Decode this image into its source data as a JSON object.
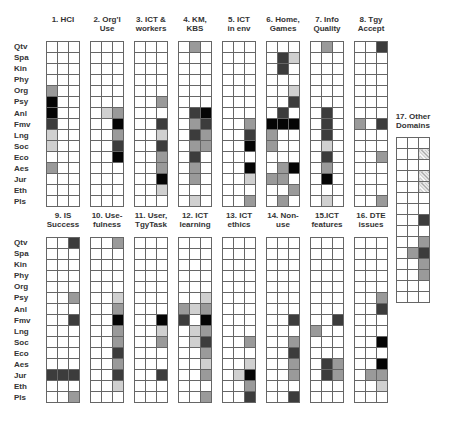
{
  "chart_data": {
    "type": "heatmap",
    "title": "",
    "rows": [
      "Qtv",
      "Spa",
      "Kin",
      "Phy",
      "Org",
      "Psy",
      "Anl",
      "Fmv",
      "Lng",
      "Soc",
      "Eco",
      "Aes",
      "Jur",
      "Eth",
      "Pls"
    ],
    "columns_per_panel": 3,
    "scale": {
      "0": "none",
      "1": "light",
      "2": "medium",
      "3": "dark",
      "4": "black",
      "h": "hatched"
    },
    "panels": [
      {
        "id": 1,
        "title": [
          "1. HCI",
          ""
        ],
        "cells": {
          "Org": [
            2,
            0,
            0
          ],
          "Psy": [
            4,
            0,
            0
          ],
          "Anl": [
            4,
            0,
            0
          ],
          "Fmv": [
            3,
            0,
            0
          ],
          "Lng": [
            1,
            0,
            0
          ],
          "Soc": [
            1,
            0,
            0
          ],
          "Aes": [
            2,
            0,
            0
          ]
        }
      },
      {
        "id": 2,
        "title": [
          "2. Org'l",
          "Use"
        ],
        "cells": {
          "Anl": [
            0,
            1,
            2
          ],
          "Fmv": [
            0,
            0,
            4
          ],
          "Lng": [
            0,
            0,
            2
          ],
          "Soc": [
            0,
            0,
            3
          ],
          "Eco": [
            0,
            0,
            4
          ]
        }
      },
      {
        "id": 3,
        "title": [
          "3. ICT &",
          "workers"
        ],
        "cells": {
          "Psy": [
            0,
            0,
            2
          ],
          "Fmv": [
            0,
            0,
            3
          ],
          "Lng": [
            0,
            0,
            1
          ],
          "Soc": [
            0,
            0,
            3
          ],
          "Eco": [
            0,
            0,
            2
          ],
          "Aes": [
            0,
            0,
            2
          ],
          "Jur": [
            0,
            0,
            4
          ],
          "Eth": [
            0,
            0,
            1
          ]
        }
      },
      {
        "id": 4,
        "title": [
          "4. KM,",
          "KBS"
        ],
        "cells": {
          "Qtv": [
            0,
            2,
            0
          ],
          "Anl": [
            0,
            3,
            4
          ],
          "Fmv": [
            0,
            2,
            3
          ],
          "Lng": [
            0,
            3,
            2
          ],
          "Soc": [
            0,
            2,
            2
          ],
          "Eco": [
            0,
            3,
            0
          ],
          "Aes": [
            0,
            2,
            0
          ],
          "Jur": [
            0,
            2,
            0
          ],
          "Pls": [
            0,
            1,
            0
          ]
        }
      },
      {
        "id": 5,
        "title": [
          "5. ICT",
          "in env"
        ],
        "cells": {
          "Fmv": [
            0,
            0,
            2
          ],
          "Lng": [
            0,
            0,
            3
          ],
          "Soc": [
            0,
            0,
            4
          ],
          "Aes": [
            0,
            0,
            4
          ],
          "Jur": [
            0,
            0,
            1
          ],
          "Pls": [
            0,
            0,
            2
          ]
        }
      },
      {
        "id": 6,
        "title": [
          "6. Home,",
          "Games"
        ],
        "cells": {
          "Spa": [
            0,
            3,
            1
          ],
          "Kin": [
            0,
            3,
            0
          ],
          "Org": [
            0,
            0,
            1
          ],
          "Psy": [
            0,
            0,
            3
          ],
          "Anl": [
            0,
            3,
            0
          ],
          "Fmv": [
            4,
            4,
            4
          ],
          "Lng": [
            2,
            0,
            0
          ],
          "Soc": [
            2,
            0,
            0
          ],
          "Aes": [
            0,
            2,
            4
          ],
          "Jur": [
            2,
            2,
            0
          ],
          "Eth": [
            0,
            0,
            2
          ],
          "Pls": [
            0,
            2,
            0
          ]
        }
      },
      {
        "id": 7,
        "title": [
          "7. Info",
          "Quality"
        ],
        "cells": {
          "Qtv": [
            0,
            2,
            0
          ],
          "Anl": [
            0,
            3,
            0
          ],
          "Fmv": [
            0,
            3,
            0
          ],
          "Lng": [
            0,
            3,
            0
          ],
          "Soc": [
            0,
            1,
            0
          ],
          "Eco": [
            0,
            3,
            0
          ],
          "Aes": [
            0,
            2,
            0
          ],
          "Jur": [
            0,
            4,
            0
          ],
          "Pls": [
            0,
            1,
            0
          ]
        }
      },
      {
        "id": 8,
        "title": [
          "8. Tgy",
          "Accept"
        ],
        "cells": {
          "Qtv": [
            0,
            0,
            3
          ],
          "Fmv": [
            2,
            0,
            3
          ],
          "Eco": [
            0,
            0,
            2
          ],
          "Pls": [
            0,
            0,
            2
          ]
        }
      },
      {
        "id": 9,
        "title": [
          "9. IS",
          "Success"
        ],
        "cells": {
          "Qtv": [
            0,
            0,
            3
          ],
          "Psy": [
            0,
            0,
            2
          ],
          "Fmv": [
            0,
            0,
            3
          ],
          "Jur": [
            3,
            3,
            3
          ],
          "Pls": [
            0,
            0,
            2
          ]
        }
      },
      {
        "id": 10,
        "title": [
          "10. Use-",
          "fulness"
        ],
        "cells": {
          "Qtv": [
            0,
            0,
            2
          ],
          "Psy": [
            0,
            0,
            1
          ],
          "Anl": [
            0,
            0,
            2
          ],
          "Fmv": [
            0,
            0,
            4
          ],
          "Lng": [
            0,
            0,
            2
          ],
          "Soc": [
            0,
            0,
            2
          ],
          "Eco": [
            0,
            0,
            3
          ],
          "Aes": [
            0,
            0,
            2
          ],
          "Jur": [
            0,
            0,
            3
          ],
          "Eth": [
            0,
            0,
            1
          ]
        }
      },
      {
        "id": 11,
        "title": [
          "11. User,",
          "TgyTask"
        ],
        "cells": {
          "Fmv": [
            0,
            0,
            4
          ],
          "Lng": [
            0,
            0,
            1
          ],
          "Soc": [
            0,
            0,
            2
          ],
          "Jur": [
            0,
            0,
            3
          ]
        }
      },
      {
        "id": 12,
        "title": [
          "12. ICT",
          "learning"
        ],
        "cells": {
          "Psy": [
            0,
            0,
            1
          ],
          "Anl": [
            2,
            1,
            2
          ],
          "Fmv": [
            3,
            0,
            4
          ],
          "Lng": [
            0,
            1,
            2
          ],
          "Soc": [
            0,
            1,
            3
          ],
          "Eco": [
            0,
            0,
            2
          ],
          "Aes": [
            0,
            0,
            1
          ],
          "Jur": [
            0,
            0,
            2
          ],
          "Pls": [
            0,
            0,
            2
          ]
        }
      },
      {
        "id": 13,
        "title": [
          "13. ICT",
          "ethics"
        ],
        "cells": {
          "Soc": [
            0,
            0,
            2
          ],
          "Aes": [
            0,
            0,
            1
          ],
          "Jur": [
            0,
            1,
            4
          ],
          "Eth": [
            0,
            0,
            2
          ],
          "Pls": [
            0,
            0,
            3
          ]
        }
      },
      {
        "id": 14,
        "title": [
          "14. Non-",
          "use"
        ],
        "cells": {
          "Fmv": [
            0,
            0,
            3
          ],
          "Soc": [
            0,
            0,
            2
          ],
          "Eco": [
            0,
            0,
            3
          ],
          "Aes": [
            0,
            0,
            2
          ],
          "Jur": [
            0,
            0,
            2
          ],
          "Pls": [
            0,
            0,
            3
          ]
        }
      },
      {
        "id": 15,
        "title": [
          "15.ICT",
          "features"
        ],
        "cells": {
          "Fmv": [
            0,
            0,
            3
          ],
          "Lng": [
            2,
            0,
            0
          ],
          "Aes": [
            0,
            3,
            2
          ],
          "Jur": [
            0,
            3,
            2
          ]
        }
      },
      {
        "id": 16,
        "title": [
          "16. DTE",
          "issues"
        ],
        "cells": {
          "Psy": [
            0,
            0,
            2
          ],
          "Anl": [
            0,
            0,
            3
          ],
          "Soc": [
            0,
            0,
            4
          ],
          "Aes": [
            0,
            0,
            4
          ],
          "Jur": [
            0,
            2,
            2
          ],
          "Eth": [
            0,
            0,
            1
          ]
        }
      },
      {
        "id": 17,
        "title": [
          "17. Other",
          "Domains"
        ],
        "cells": {
          "Spa": [
            0,
            0,
            "h"
          ],
          "Phy": [
            0,
            0,
            "h"
          ],
          "Org": [
            0,
            0,
            "h"
          ],
          "Fmv": [
            0,
            0,
            3
          ],
          "Soc": [
            0,
            0,
            2
          ],
          "Eco": [
            0,
            2,
            3
          ],
          "Aes": [
            0,
            0,
            2
          ],
          "Jur": [
            0,
            0,
            2
          ]
        }
      }
    ]
  }
}
